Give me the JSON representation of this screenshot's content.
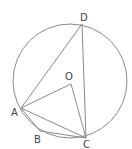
{
  "diagram": {
    "type": "circle-geometry",
    "stroke_color": "#8a8a8a",
    "label_color": "#444444",
    "circle": {
      "cx": 70,
      "cy": 81,
      "r": 57
    },
    "points": {
      "D": {
        "label": "D",
        "x": 82,
        "y": 24,
        "lx": 80,
        "ly": 21
      },
      "O": {
        "label": "O",
        "x": 71,
        "y": 84,
        "lx": 65,
        "ly": 80
      },
      "A": {
        "label": "A",
        "x": 21,
        "y": 108,
        "lx": 11,
        "ly": 116
      },
      "B": {
        "label": "B",
        "x": 40,
        "y": 131,
        "lx": 34,
        "ly": 143
      },
      "C": {
        "label": "C",
        "x": 86,
        "y": 138,
        "lx": 83,
        "ly": 148
      }
    },
    "segments": [
      "AD",
      "DC",
      "AO",
      "OC",
      "AB",
      "BC",
      "AC"
    ]
  }
}
